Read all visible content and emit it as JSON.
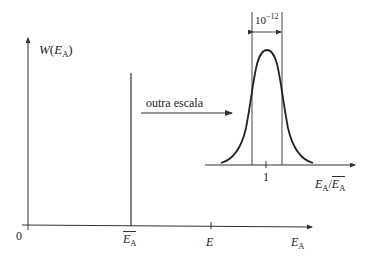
{
  "main_plot": {
    "y_axis_label": {
      "func": "W",
      "open": "(",
      "var": "E",
      "sub": "A",
      "close": ")"
    },
    "origin_label": "0",
    "x_axis_label": {
      "var": "E",
      "sub": "A"
    },
    "mean_label": {
      "var": "E",
      "sub": "A",
      "overline": true
    },
    "tick_label_E": "E",
    "spike_at": "mean energy E_A (overlined)"
  },
  "annotation": {
    "arrow_text": "outra escala"
  },
  "inset_plot": {
    "width_label": {
      "base": "10",
      "exp": "−12"
    },
    "tick_label": "1",
    "x_axis_label": {
      "num_var": "E",
      "num_sub": "A",
      "slash": "/",
      "den_var": "E",
      "den_sub": "A",
      "den_overline": true
    },
    "curve": "bell-shaped peak centered at 1"
  },
  "colors": {
    "stroke": "#333333",
    "background": "#ffffff"
  }
}
